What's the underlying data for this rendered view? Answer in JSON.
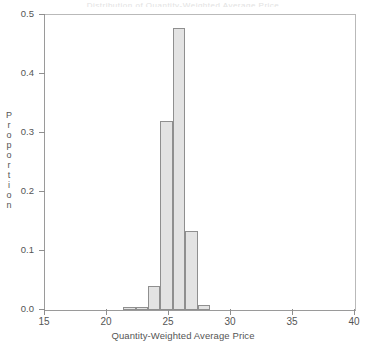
{
  "figure": {
    "title_remnant": "Distribution of Quantity-Weighted Average Price",
    "background_color": "#ffffff",
    "frame_color": "#9a9a9a"
  },
  "axes": {
    "x": {
      "label": "Quantity-Weighted Average Price",
      "ticks": [
        "15",
        "20",
        "25",
        "30",
        "35",
        "40"
      ],
      "tick_values": [
        15,
        20,
        25,
        30,
        35,
        40
      ],
      "min": 15,
      "max": 40
    },
    "y": {
      "label": "Proportion",
      "label_letters": [
        "P",
        "r",
        "o",
        "p",
        "o",
        "r",
        "t",
        "i",
        "o",
        "n"
      ],
      "ticks": [
        "0.0",
        "0.1",
        "0.2",
        "0.3",
        "0.4",
        "0.5"
      ],
      "tick_values": [
        0.0,
        0.1,
        0.2,
        0.3,
        0.4,
        0.5
      ],
      "min": 0.0,
      "max": 0.5
    }
  },
  "chart_data": {
    "type": "bar",
    "title": "",
    "xlabel": "Quantity-Weighted Average Price",
    "ylabel": "Proportion",
    "xlim": [
      15,
      40
    ],
    "ylim": [
      0,
      0.5
    ],
    "grid": false,
    "legend": null,
    "bin_width": 1,
    "bar_fill_color": "#e3e3e3",
    "bar_edge_color": "#8f8f8f",
    "bins": [
      {
        "x_start": 21.3,
        "x_end": 22.3,
        "center": 21.8,
        "value": 0.005
      },
      {
        "x_start": 22.3,
        "x_end": 23.3,
        "center": 22.8,
        "value": 0.005
      },
      {
        "x_start": 23.3,
        "x_end": 24.3,
        "center": 23.8,
        "value": 0.04
      },
      {
        "x_start": 24.3,
        "x_end": 25.3,
        "center": 24.8,
        "value": 0.32
      },
      {
        "x_start": 25.3,
        "x_end": 26.3,
        "center": 25.8,
        "value": 0.478
      },
      {
        "x_start": 26.3,
        "x_end": 27.3,
        "center": 26.8,
        "value": 0.134
      },
      {
        "x_start": 27.3,
        "x_end": 28.3,
        "center": 27.8,
        "value": 0.008
      }
    ],
    "categories": [
      "21.8",
      "22.8",
      "23.8",
      "24.8",
      "25.8",
      "26.8",
      "27.8"
    ],
    "values": [
      0.005,
      0.005,
      0.04,
      0.32,
      0.478,
      0.134,
      0.008
    ]
  }
}
